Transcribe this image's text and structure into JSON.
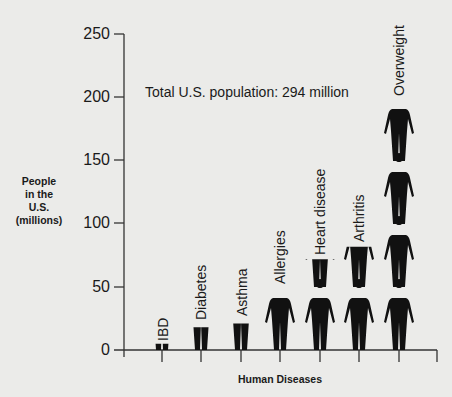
{
  "chart_data": {
    "type": "bar",
    "style": "pictograph (stacked human silhouettes)",
    "title": "",
    "annotation": "Total U.S. population: 294 million",
    "xlabel": "Human Diseases",
    "ylabel": "People\nin the\nU.S.\n(millions)",
    "ylim": [
      0,
      250
    ],
    "yticks": [
      "0",
      "50",
      "100",
      "150",
      "200",
      "250"
    ],
    "categories": [
      "IBD",
      "Diabetes",
      "Asthma",
      "Allergies",
      "Heart disease",
      "Arthritis",
      "Overweight"
    ],
    "values": [
      5,
      18,
      21,
      48,
      72,
      82,
      198
    ],
    "grid": false,
    "legend": null
  }
}
